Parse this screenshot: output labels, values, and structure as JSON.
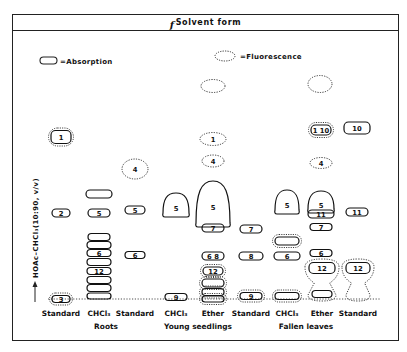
{
  "header": {
    "prefix": "f",
    "title": "Solvent form"
  },
  "legend": {
    "absorption": "=Absorption",
    "fluorescence": "=Fluorescence"
  },
  "y_axis_label": "HOAc–CHCl₃(10:90, v/v)",
  "lanes": [
    {
      "id": "roots-standard",
      "label": "Standard",
      "x": 61
    },
    {
      "id": "roots-chcl3",
      "label": "CHCl₃",
      "x": 99
    },
    {
      "id": "roots-standard-2",
      "label": "Standard",
      "x": 135
    },
    {
      "id": "seedlings-chcl3",
      "label": "CHCl₃",
      "x": 176
    },
    {
      "id": "seedlings-ether",
      "label": "Ether",
      "x": 213
    },
    {
      "id": "seedlings-standard",
      "label": "Standard",
      "x": 251
    },
    {
      "id": "leaves-chcl3",
      "label": "CHCl₃",
      "x": 287
    },
    {
      "id": "leaves-ether",
      "label": "Ether",
      "x": 322
    },
    {
      "id": "leaves-standard",
      "label": "Standard",
      "x": 358
    }
  ],
  "groups": [
    {
      "label": "Roots",
      "x": 106
    },
    {
      "label": "Young seedlings",
      "x": 198
    },
    {
      "label": "Fallen leaves",
      "x": 306
    }
  ],
  "spots": [
    {
      "lane": "roots-standard",
      "type": "abs",
      "x": 61,
      "y": 137,
      "w": 20,
      "h": 13,
      "label": "1",
      "fluor_halo": true
    },
    {
      "lane": "roots-standard",
      "type": "abs",
      "x": 61,
      "y": 213,
      "w": 18,
      "h": 8,
      "label": "2"
    },
    {
      "lane": "roots-standard",
      "type": "abs",
      "x": 61,
      "y": 299,
      "w": 18,
      "h": 7,
      "label": "3",
      "fluor_halo": true
    },
    {
      "lane": "roots-chcl3",
      "type": "abs",
      "x": 99,
      "y": 194,
      "w": 26,
      "h": 8,
      "label": ""
    },
    {
      "lane": "roots-chcl3",
      "type": "abs",
      "x": 99,
      "y": 213,
      "w": 22,
      "h": 8,
      "label": "5"
    },
    {
      "lane": "roots-chcl3",
      "type": "abs",
      "x": 99,
      "y": 237,
      "w": 22,
      "h": 7,
      "label": ""
    },
    {
      "lane": "roots-chcl3",
      "type": "abs",
      "x": 99,
      "y": 245,
      "w": 24,
      "h": 7,
      "label": ""
    },
    {
      "lane": "roots-chcl3",
      "type": "abs",
      "x": 99,
      "y": 253,
      "w": 24,
      "h": 7,
      "label": "6"
    },
    {
      "lane": "roots-chcl3",
      "type": "abs",
      "x": 99,
      "y": 262,
      "w": 24,
      "h": 7,
      "label": ""
    },
    {
      "lane": "roots-chcl3",
      "type": "abs",
      "x": 99,
      "y": 271,
      "w": 24,
      "h": 7,
      "label": "12"
    },
    {
      "lane": "roots-chcl3",
      "type": "abs",
      "x": 99,
      "y": 280,
      "w": 24,
      "h": 7,
      "label": ""
    },
    {
      "lane": "roots-chcl3",
      "type": "abs",
      "x": 99,
      "y": 288,
      "w": 24,
      "h": 7,
      "label": ""
    },
    {
      "lane": "roots-chcl3",
      "type": "abs",
      "x": 99,
      "y": 296,
      "w": 24,
      "h": 6,
      "label": ""
    },
    {
      "lane": "roots-standard-2",
      "type": "fluor",
      "x": 135,
      "y": 169,
      "w": 26,
      "h": 20,
      "label": "4"
    },
    {
      "lane": "roots-standard-2",
      "type": "abs",
      "x": 135,
      "y": 210,
      "w": 20,
      "h": 8,
      "label": "5"
    },
    {
      "lane": "roots-standard-2",
      "type": "abs",
      "x": 135,
      "y": 255,
      "w": 20,
      "h": 7,
      "label": "6"
    },
    {
      "lane": "seedlings-chcl3",
      "type": "blob",
      "x": 176,
      "y": 205,
      "w": 26,
      "h": 24,
      "label": "5"
    },
    {
      "lane": "seedlings-chcl3",
      "type": "abs",
      "x": 176,
      "y": 297,
      "w": 22,
      "h": 7,
      "label": "9"
    },
    {
      "lane": "seedlings-ether",
      "type": "fluor",
      "x": 213,
      "y": 86,
      "w": 24,
      "h": 13,
      "label": ""
    },
    {
      "lane": "seedlings-ether",
      "type": "fluor",
      "x": 213,
      "y": 139,
      "w": 26,
      "h": 13,
      "label": "1"
    },
    {
      "lane": "seedlings-ether",
      "type": "fluor",
      "x": 213,
      "y": 161,
      "w": 22,
      "h": 12,
      "label": "4"
    },
    {
      "lane": "seedlings-ether",
      "type": "blob",
      "x": 213,
      "y": 204,
      "w": 34,
      "h": 46,
      "label": "5"
    },
    {
      "lane": "seedlings-ether",
      "type": "abs",
      "x": 213,
      "y": 228,
      "w": 22,
      "h": 8,
      "label": "7"
    },
    {
      "lane": "seedlings-ether",
      "type": "abs",
      "x": 213,
      "y": 256,
      "w": 22,
      "h": 8,
      "label": "6  8"
    },
    {
      "lane": "seedlings-ether",
      "type": "abs",
      "x": 213,
      "y": 271,
      "w": 20,
      "h": 8,
      "label": "12",
      "fluor_halo": true
    },
    {
      "lane": "seedlings-ether",
      "type": "abs",
      "x": 213,
      "y": 283,
      "w": 22,
      "h": 8,
      "label": "",
      "fluor_halo": true
    },
    {
      "lane": "seedlings-ether",
      "type": "abs",
      "x": 213,
      "y": 292,
      "w": 22,
      "h": 7,
      "label": "",
      "fluor_halo": true
    },
    {
      "lane": "seedlings-ether",
      "type": "abs",
      "x": 213,
      "y": 299,
      "w": 22,
      "h": 6,
      "label": "",
      "fluor_halo": true
    },
    {
      "lane": "seedlings-standard",
      "type": "abs",
      "x": 251,
      "y": 229,
      "w": 22,
      "h": 8,
      "label": "7"
    },
    {
      "lane": "seedlings-standard",
      "type": "abs",
      "x": 251,
      "y": 256,
      "w": 24,
      "h": 8,
      "label": "8"
    },
    {
      "lane": "seedlings-standard",
      "type": "abs",
      "x": 251,
      "y": 296,
      "w": 22,
      "h": 7,
      "label": "9",
      "fluor_halo": true
    },
    {
      "lane": "leaves-chcl3",
      "type": "blob",
      "x": 287,
      "y": 202,
      "w": 24,
      "h": 24,
      "label": "5"
    },
    {
      "lane": "leaves-chcl3",
      "type": "abs",
      "x": 287,
      "y": 241,
      "w": 24,
      "h": 8,
      "label": "",
      "fluor_halo": true
    },
    {
      "lane": "leaves-chcl3",
      "type": "abs",
      "x": 287,
      "y": 256,
      "w": 26,
      "h": 8,
      "label": "6"
    },
    {
      "lane": "leaves-chcl3",
      "type": "abs",
      "x": 287,
      "y": 296,
      "w": 24,
      "h": 7,
      "label": "",
      "fluor_halo": true
    },
    {
      "lane": "leaves-ether",
      "type": "fluor",
      "x": 320,
      "y": 84,
      "w": 24,
      "h": 17,
      "label": ""
    },
    {
      "lane": "leaves-ether",
      "type": "abs",
      "x": 321,
      "y": 130,
      "w": 20,
      "h": 10,
      "label": "1 10",
      "fluor_halo": true
    },
    {
      "lane": "leaves-ether",
      "type": "fluor",
      "x": 321,
      "y": 163,
      "w": 22,
      "h": 11,
      "label": "4"
    },
    {
      "lane": "leaves-ether",
      "type": "blob",
      "x": 321,
      "y": 202,
      "w": 26,
      "h": 22,
      "label": "5"
    },
    {
      "lane": "leaves-ether",
      "type": "abs",
      "x": 321,
      "y": 214,
      "w": 26,
      "h": 8,
      "label": "11"
    },
    {
      "lane": "leaves-ether",
      "type": "abs",
      "x": 321,
      "y": 227,
      "w": 22,
      "h": 7,
      "label": "7"
    },
    {
      "lane": "leaves-ether",
      "type": "abs",
      "x": 321,
      "y": 253,
      "w": 22,
      "h": 7,
      "label": "6"
    },
    {
      "lane": "leaves-ether",
      "type": "abs",
      "x": 322,
      "y": 268,
      "w": 26,
      "h": 11,
      "label": "12"
    },
    {
      "lane": "leaves-ether",
      "type": "abs",
      "x": 322,
      "y": 294,
      "w": 20,
      "h": 7,
      "label": ""
    },
    {
      "lane": "leaves-standard",
      "type": "abs",
      "x": 357,
      "y": 128,
      "w": 26,
      "h": 12,
      "label": "10"
    },
    {
      "lane": "leaves-standard",
      "type": "abs",
      "x": 357,
      "y": 212,
      "w": 22,
      "h": 8,
      "label": "11"
    },
    {
      "lane": "leaves-standard",
      "type": "abs",
      "x": 358,
      "y": 268,
      "w": 24,
      "h": 11,
      "label": "12"
    }
  ],
  "flasks": [
    {
      "lane": "leaves-ether",
      "cx": 322,
      "top": 259,
      "bottom": 301,
      "wtop": 34,
      "wbot": 28
    },
    {
      "lane": "leaves-standard",
      "cx": 358,
      "top": 259,
      "bottom": 301,
      "wtop": 32,
      "wbot": 24
    }
  ],
  "origin_line_y": 299
}
